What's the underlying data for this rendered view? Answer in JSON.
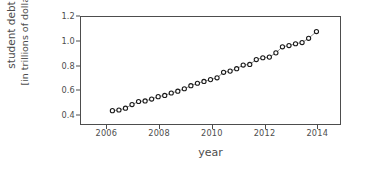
{
  "chart_data": {
    "type": "scatter",
    "title": "",
    "xlabel": "year",
    "ylabel": "student debt\n[in trillions of dollars]",
    "ylabel_line1": "student debt",
    "ylabel_line2": "[in trillions of dollars]",
    "xlim": [
      2005.0,
      2014.9
    ],
    "ylim": [
      0.32,
      1.2
    ],
    "xticks": [
      2006,
      2008,
      2010,
      2012,
      2014
    ],
    "xtick_labels": [
      "2006",
      "2008",
      "2010",
      "2012",
      "2014"
    ],
    "yticks": [
      0.4,
      0.6,
      0.8,
      1.0,
      1.2
    ],
    "ytick_labels": [
      "0.4",
      "0.6",
      "0.8",
      "1.0",
      "1.2"
    ],
    "grid": false,
    "legend": null,
    "marker": "open-circle",
    "marker_facecolor": "#ffffff",
    "marker_edgecolor": "#1a1a1a",
    "line_color": "#808080",
    "axes_color": "#4d4d4d",
    "x": [
      2006.2,
      2006.45,
      2006.7,
      2006.95,
      2007.2,
      2007.45,
      2007.7,
      2007.95,
      2008.2,
      2008.45,
      2008.7,
      2008.95,
      2009.2,
      2009.45,
      2009.7,
      2009.95,
      2010.2,
      2010.45,
      2010.7,
      2010.95,
      2011.2,
      2011.45,
      2011.7,
      2011.95,
      2012.2,
      2012.45,
      2012.7,
      2012.95,
      2013.2,
      2013.45,
      2013.7,
      2014.0
    ],
    "y": [
      0.43,
      0.435,
      0.45,
      0.48,
      0.505,
      0.51,
      0.525,
      0.545,
      0.555,
      0.575,
      0.59,
      0.61,
      0.635,
      0.655,
      0.67,
      0.685,
      0.7,
      0.745,
      0.755,
      0.775,
      0.805,
      0.81,
      0.85,
      0.865,
      0.87,
      0.905,
      0.955,
      0.965,
      0.98,
      0.99,
      1.025,
      1.08
    ]
  }
}
